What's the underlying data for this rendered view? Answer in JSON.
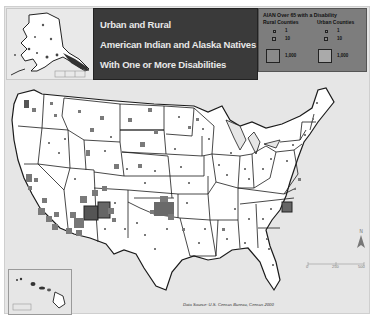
{
  "title": {
    "lines": [
      "Urban and Rural",
      "American Indian and Alaska Natives",
      "With One or More Disabilities"
    ],
    "panel_color": "#3a3a3a",
    "text_color": "#e8e8e8"
  },
  "legend": {
    "title": "AIAN Over 65 with a Disability",
    "columns": [
      {
        "label": "Rural Counties",
        "values": [
          "1",
          "10",
          "1,000"
        ]
      },
      {
        "label": "Urban Counties",
        "values": [
          "1",
          "10",
          "1,000"
        ]
      }
    ],
    "background": "#7d7d7d",
    "symbol_color": "#8a8a8a"
  },
  "insets": {
    "alaska": {
      "label": "Alaska"
    },
    "hawaii": {
      "label": "Hawaii"
    }
  },
  "source": "Data Source: U.S. Census Bureau, Census 2000",
  "north_arrow": {
    "label": "N"
  },
  "scale_bar": {
    "labels": [
      "0",
      "250",
      "500"
    ],
    "unit": "Miles"
  },
  "map": {
    "land_color": "#ffffff",
    "water_color": "#e6e6e6",
    "border_color": "#1a1a1a",
    "symbol_color": "#7a7a7a",
    "concentrations": [
      {
        "region": "Arizona / New Mexico (Navajo Nation)",
        "intensity": "very high"
      },
      {
        "region": "Oklahoma",
        "intensity": "very high"
      },
      {
        "region": "Southern California",
        "intensity": "high"
      },
      {
        "region": "Robeson County, North Carolina",
        "intensity": "high"
      },
      {
        "region": "Northern Plains (Dakotas, Montana)",
        "intensity": "moderate"
      }
    ]
  }
}
